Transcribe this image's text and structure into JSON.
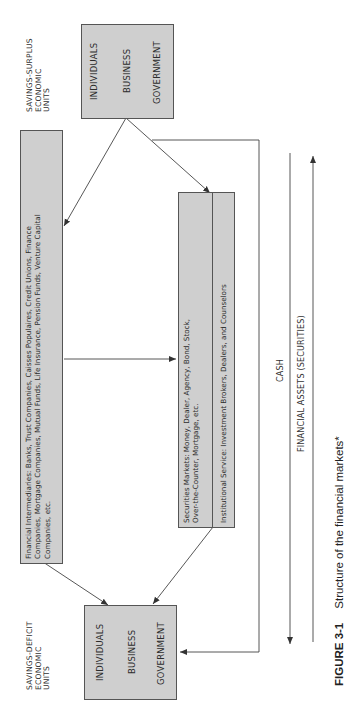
{
  "figure": {
    "number": "FIGURE 3-1",
    "title": "Structure of the financial markets*"
  },
  "surplus_units": {
    "label_lines": [
      "SAVINGS-SURPLUS",
      "ECONOMIC",
      "UNITS"
    ],
    "members": [
      "INDIVIDUALS",
      "BUSINESS",
      "GOVERNMENT"
    ]
  },
  "deficit_units": {
    "label_lines": [
      "SAVINGS-DEFICIT",
      "ECONOMIC",
      "UNITS"
    ],
    "members": [
      "INDIVIDUALS",
      "BUSINESS",
      "GOVERNMENT"
    ]
  },
  "intermediaries": {
    "lines": [
      "Financial Intermediaries: Banks, Trust Companies, Caisses Populaires, Credit Unions, Finance",
      "Companies, Mortgage Companies, Mutual Funds, Life Insurance, Pension Funds, Venture Capital",
      "Companies, etc."
    ]
  },
  "securities_markets": {
    "lines": [
      "Securities Markets: Money, Dealer, Agency, Bond, Stock,",
      "Over-the-Counter, Mortgage, etc."
    ]
  },
  "institutional_service": {
    "text": "Institutional Service: Investment Brokers, Dealers, and Counselors"
  },
  "flows": {
    "cash": "CASH",
    "financial_assets": "FINANCIAL ASSETS (SECURITIES)"
  },
  "colors": {
    "box_fill": "#cfcfcf",
    "line": "#444444",
    "background": "#ffffff"
  }
}
